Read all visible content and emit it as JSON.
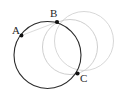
{
  "figure": {
    "kind": "geometry-diagram",
    "background_color": "#ffffff",
    "width": 120,
    "height": 98,
    "colors": {
      "primary_stroke": "#2b2b2b",
      "secondary_stroke": "#c8c8c8",
      "tertiary_stroke": "#d6d6d6",
      "point_fill": "#111111",
      "label_text": "#262626"
    },
    "circles": [
      {
        "id": "circle-main",
        "style": "solid-dark",
        "stroke": "#2b2b2b",
        "stroke_width": 1.1,
        "cx": 47.5,
        "cy": 55,
        "r": 33.5
      },
      {
        "id": "circle-middle",
        "style": "solid-light",
        "stroke": "#c8c8c8",
        "stroke_width": 0.9,
        "cx": 70,
        "cy": 47,
        "r": 27.5
      },
      {
        "id": "circle-right",
        "style": "solid-light",
        "stroke": "#d2d2d2",
        "stroke_width": 0.9,
        "cx": 84,
        "cy": 41,
        "r": 29.5
      }
    ],
    "points": [
      {
        "id": "point-a",
        "label": "A",
        "x": 21.5,
        "y": 35.5,
        "label_x": 12,
        "label_y": 25,
        "dot_radius": 1.9
      },
      {
        "id": "point-b",
        "label": "B",
        "x": 57,
        "y": 22,
        "label_x": 50,
        "label_y": 8,
        "dot_radius": 2.1
      },
      {
        "id": "point-c",
        "label": "C",
        "x": 77.5,
        "y": 73.5,
        "label_x": 80,
        "label_y": 73,
        "dot_radius": 2.1
      }
    ],
    "chords": [
      {
        "id": "chord-ab",
        "from": "point-a",
        "to": "point-b"
      }
    ]
  }
}
